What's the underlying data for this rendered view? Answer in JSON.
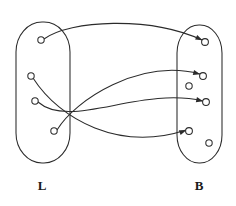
{
  "diagram": {
    "type": "mapping-diagram",
    "title": "",
    "canvas": {
      "width": 236,
      "height": 206
    },
    "stroke_color": "#2b2b2b",
    "fill_color": "#ffffff",
    "label_color": "#1a1a1a"
  },
  "sets": [
    {
      "id": "L",
      "label": "L",
      "label_x": 42,
      "label_y": 190,
      "outline": {
        "x": 16,
        "y": 22,
        "width": 54,
        "height": 141,
        "rx": 26,
        "ry": 30
      }
    },
    {
      "id": "B",
      "label": "B",
      "label_x": 199,
      "label_y": 190,
      "outline": {
        "x": 177,
        "y": 25,
        "width": 45,
        "height": 138,
        "rx": 22,
        "ry": 28
      }
    }
  ],
  "nodes": [
    {
      "id": "l1",
      "set": "L",
      "cx": 41,
      "cy": 40,
      "r": 3.2
    },
    {
      "id": "l2",
      "set": "L",
      "cx": 31,
      "cy": 76,
      "r": 3.2
    },
    {
      "id": "l3",
      "set": "L",
      "cx": 35,
      "cy": 101,
      "r": 3.2
    },
    {
      "id": "l4",
      "set": "L",
      "cx": 54,
      "cy": 131,
      "r": 3.2
    },
    {
      "id": "b1",
      "set": "B",
      "cx": 205,
      "cy": 42,
      "r": 3.4
    },
    {
      "id": "b2",
      "set": "B",
      "cx": 203,
      "cy": 76,
      "r": 3.4
    },
    {
      "id": "b3",
      "set": "B",
      "cx": 189,
      "cy": 86,
      "r": 3.2
    },
    {
      "id": "b4",
      "set": "B",
      "cx": 206,
      "cy": 102,
      "r": 3.4
    },
    {
      "id": "b5",
      "set": "B",
      "cx": 189,
      "cy": 131,
      "r": 3.4
    },
    {
      "id": "b6",
      "set": "B",
      "cx": 209,
      "cy": 143,
      "r": 3.2
    }
  ],
  "edges": [
    {
      "id": "e1",
      "from": "l1",
      "to": "b1",
      "path": "M 44 39 C 70 20 150 16 202 40",
      "arrow": {
        "x": 202.5,
        "y": 40.2,
        "angle": 25
      }
    },
    {
      "id": "e2",
      "from": "l4",
      "to": "b2",
      "path": "M 57 130 C 75 100 140 58 200 74",
      "arrow": {
        "x": 200.2,
        "y": 74.3,
        "angle": 15
      }
    },
    {
      "id": "e3",
      "from": "l3",
      "to": "b4",
      "path": "M 38 102 C 70 130 140 86 203 101",
      "arrow": {
        "x": 203.2,
        "y": 101.2,
        "angle": 13
      }
    },
    {
      "id": "e4",
      "from": "l2",
      "to": "b5",
      "path": "M 33 78 C 60 120 120 152 186 130",
      "arrow": {
        "x": 186.3,
        "y": 130.2,
        "angle": -20
      }
    }
  ],
  "unmapped_targets": [
    "b3",
    "b6"
  ]
}
